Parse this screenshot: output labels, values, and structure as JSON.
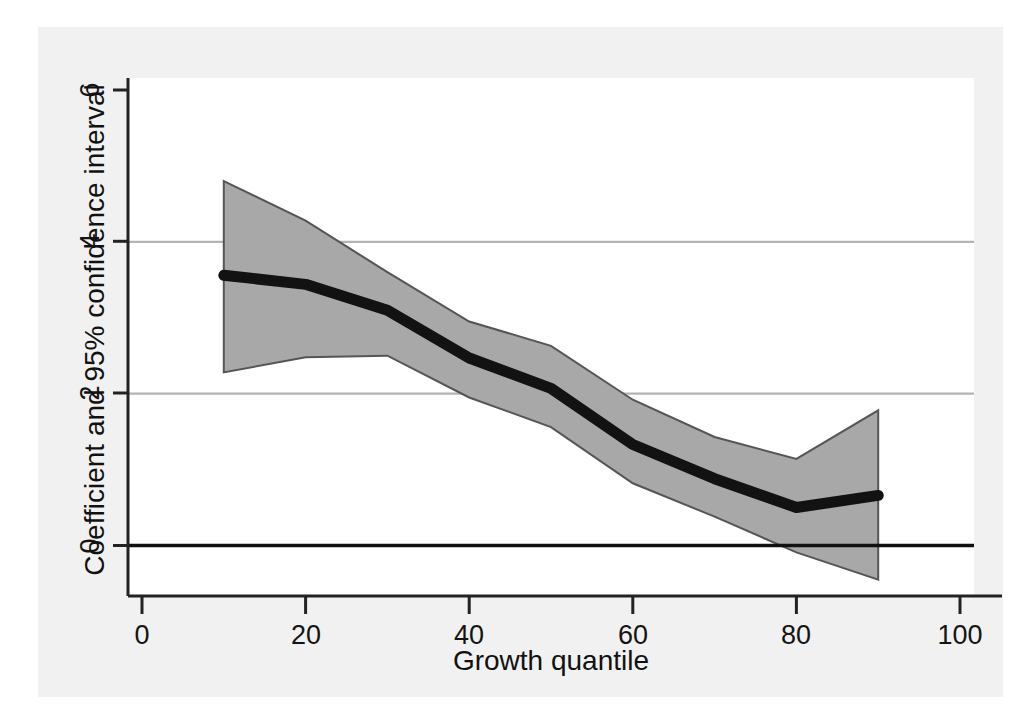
{
  "figure": {
    "background_color": "#f1f1f1",
    "plot_background_color": "#ffffff"
  },
  "axes": {
    "x_title": "Growth quantile",
    "y_title": "Coefficient and 95% confidence interval",
    "x_ticks": [
      "0",
      "20",
      "40",
      "60",
      "80",
      "100"
    ],
    "y_ticks": [
      "0",
      "2",
      "4",
      "6"
    ]
  },
  "chart_data": {
    "type": "line",
    "title": "",
    "subtitle": "",
    "xlabel": "Growth quantile",
    "ylabel": "Coefficient and 95% confidence interval",
    "xlim": [
      0,
      100
    ],
    "ylim": [
      -1.0,
      6.4
    ],
    "xticks": [
      0,
      20,
      40,
      60,
      80,
      100
    ],
    "yticks": [
      0,
      2,
      4,
      6
    ],
    "grid": "horizontal gridlines at y = 2 and y = 4; bold reference line at y = 0",
    "legend": "none",
    "colors": {
      "coefficient_line": "#121212",
      "confidence_band_fill": "#a8a8a8",
      "confidence_band_edge": "#555555",
      "gridline": "#b4b4b4",
      "zero_line": "#111111",
      "axis": "#222222"
    },
    "x": [
      10,
      20,
      30,
      40,
      50,
      60,
      70,
      80,
      90
    ],
    "series": [
      {
        "name": "Coefficient",
        "values": [
          3.56,
          3.44,
          3.1,
          2.47,
          2.07,
          1.33,
          0.88,
          0.5,
          0.66
        ]
      },
      {
        "name": "Upper 95% confidence bound",
        "values": [
          4.8,
          4.28,
          3.6,
          2.95,
          2.63,
          1.92,
          1.43,
          1.14,
          1.78
        ]
      },
      {
        "name": "Lower 95% confidence bound",
        "values": [
          2.28,
          2.48,
          2.5,
          1.95,
          1.56,
          0.82,
          0.38,
          -0.09,
          -0.45
        ]
      }
    ],
    "annotations": [
      "Coefficient declines monotonically from about 3.6 at the 10th growth quantile to about 0.5 at the 80th, then ticks up slightly to about 0.7 at the 90th.",
      "The 95% confidence band crosses zero near the 77th quantile."
    ]
  }
}
